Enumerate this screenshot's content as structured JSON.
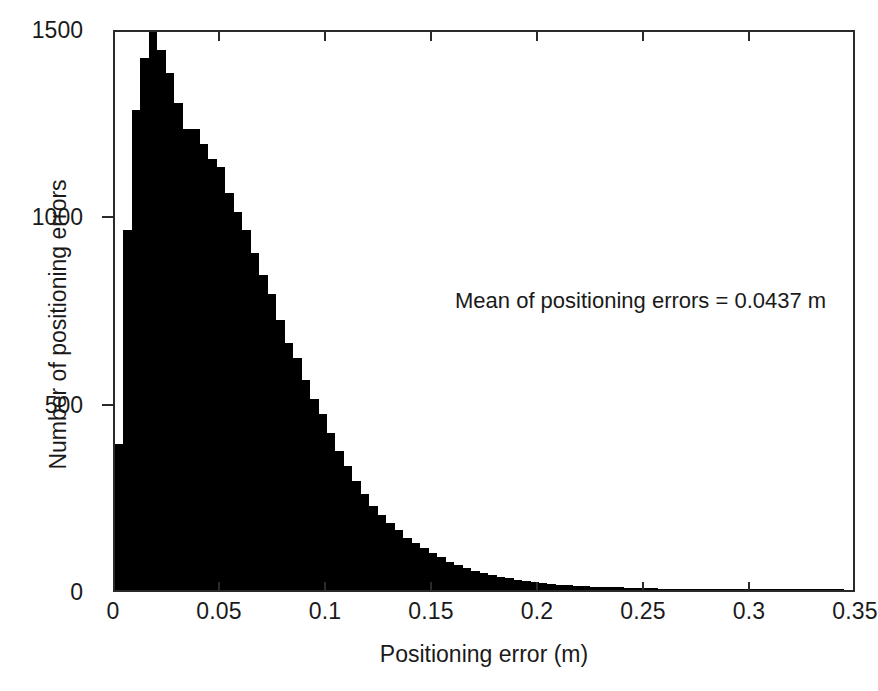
{
  "figure": {
    "background": "#ffffff",
    "bar_color": "#000000",
    "axis_color": "#2a2a2a"
  },
  "annotation": {
    "text": "Mean of positioning errors = 0.0437 m"
  },
  "axis": {
    "xlabel": "Positioning error (m)",
    "ylabel": "Number of positioning errors",
    "xticks": [
      "0",
      "0.05",
      "0.1",
      "0.15",
      "0.2",
      "0.25",
      "0.3",
      "0.35"
    ],
    "yticks": [
      "0",
      "500",
      "1000",
      "1500"
    ]
  },
  "chart_data": {
    "type": "bar",
    "title": "",
    "xlabel": "Positioning error (m)",
    "ylabel": "Number of positioning errors",
    "xlim": [
      0,
      0.35
    ],
    "ylim": [
      0,
      1500
    ],
    "grid": false,
    "legend": null,
    "annotations": [
      {
        "text": "Mean of positioning errors = 0.0437 m",
        "x": 0.161,
        "y": 810
      }
    ],
    "xtick_values": [
      0,
      0.05,
      0.1,
      0.15,
      0.2,
      0.25,
      0.3,
      0.35
    ],
    "xtick_labels": [
      "0",
      "0.05",
      "0.1",
      "0.15",
      "0.2",
      "0.25",
      "0.3",
      "0.35"
    ],
    "ytick_values": [
      0,
      500,
      1000,
      1500
    ],
    "ytick_labels": [
      "0",
      "500",
      "1000",
      "1500"
    ],
    "bin_width": 0.004,
    "mean": 0.0437,
    "bin_left_edges": [
      0.0,
      0.004,
      0.008,
      0.012,
      0.016,
      0.02,
      0.024,
      0.028,
      0.032,
      0.036,
      0.04,
      0.044,
      0.048,
      0.052,
      0.056,
      0.06,
      0.064,
      0.068,
      0.072,
      0.076,
      0.08,
      0.084,
      0.088,
      0.092,
      0.096,
      0.1,
      0.104,
      0.108,
      0.112,
      0.116,
      0.12,
      0.124,
      0.128,
      0.132,
      0.136,
      0.14,
      0.144,
      0.148,
      0.152,
      0.156,
      0.16,
      0.164,
      0.168,
      0.172,
      0.176,
      0.18,
      0.184,
      0.188,
      0.192,
      0.196,
      0.2,
      0.204,
      0.208,
      0.212,
      0.216,
      0.22,
      0.224,
      0.228,
      0.232,
      0.236,
      0.24,
      0.244,
      0.248,
      0.252,
      0.256,
      0.26,
      0.264,
      0.268,
      0.272,
      0.276,
      0.28,
      0.284,
      0.288,
      0.292,
      0.296,
      0.3,
      0.304,
      0.308,
      0.312,
      0.316,
      0.32,
      0.324,
      0.328,
      0.332,
      0.336,
      0.34,
      0.344,
      0.348
    ],
    "values": [
      390,
      960,
      1280,
      1420,
      1500,
      1440,
      1380,
      1300,
      1230,
      1230,
      1190,
      1150,
      1130,
      1060,
      1010,
      960,
      900,
      840,
      790,
      720,
      660,
      620,
      560,
      510,
      470,
      420,
      370,
      330,
      290,
      255,
      225,
      200,
      180,
      160,
      140,
      125,
      112,
      100,
      88,
      76,
      68,
      60,
      52,
      46,
      40,
      35,
      31,
      27,
      24,
      21,
      18,
      16,
      14,
      13,
      11,
      10,
      9,
      8,
      7,
      7,
      6,
      6,
      5,
      5,
      4,
      4,
      4,
      3,
      3,
      3,
      3,
      2,
      2,
      2,
      2,
      2,
      2,
      1,
      1,
      1,
      1,
      1,
      1,
      1,
      1,
      1,
      0,
      0
    ]
  }
}
